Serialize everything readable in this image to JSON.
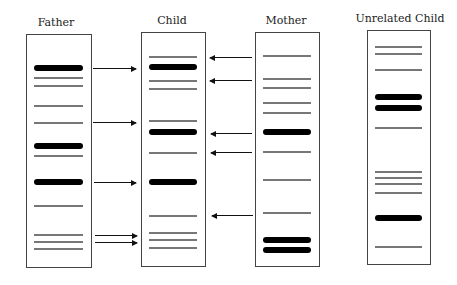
{
  "colors": {
    "thin_band": "#777777",
    "thick_band": "#000000",
    "border": "#444444",
    "arrow": "#111111"
  },
  "lanes": [
    {
      "label": "Father",
      "box": {
        "x": 26,
        "y": 34,
        "w": 66,
        "h": 234
      },
      "label_x": 56,
      "label_y": 16,
      "bands": [
        {
          "y": 68,
          "type": "thick"
        },
        {
          "y": 78,
          "type": "thin"
        },
        {
          "y": 86,
          "type": "thin"
        },
        {
          "y": 106,
          "type": "thin"
        },
        {
          "y": 123,
          "type": "thin"
        },
        {
          "y": 146,
          "type": "thick"
        },
        {
          "y": 156,
          "type": "thin"
        },
        {
          "y": 182,
          "type": "thick"
        },
        {
          "y": 206,
          "type": "thin"
        },
        {
          "y": 235,
          "type": "thin"
        },
        {
          "y": 242,
          "type": "thin"
        },
        {
          "y": 249,
          "type": "thin"
        }
      ]
    },
    {
      "label": "Child",
      "box": {
        "x": 141,
        "y": 32,
        "w": 65,
        "h": 235
      },
      "label_x": 172,
      "label_y": 14,
      "bands": [
        {
          "y": 57,
          "type": "thin"
        },
        {
          "y": 67,
          "type": "thick"
        },
        {
          "y": 81,
          "type": "thin"
        },
        {
          "y": 89,
          "type": "thin"
        },
        {
          "y": 121,
          "type": "thin"
        },
        {
          "y": 132,
          "type": "thick"
        },
        {
          "y": 153,
          "type": "thin"
        },
        {
          "y": 182,
          "type": "thick"
        },
        {
          "y": 216,
          "type": "thin"
        },
        {
          "y": 233,
          "type": "thin"
        },
        {
          "y": 240,
          "type": "thin"
        },
        {
          "y": 248,
          "type": "thin"
        }
      ]
    },
    {
      "label": "Mother",
      "box": {
        "x": 255,
        "y": 32,
        "w": 65,
        "h": 235
      },
      "label_x": 286,
      "label_y": 14,
      "bands": [
        {
          "y": 56,
          "type": "thin"
        },
        {
          "y": 79,
          "type": "thin"
        },
        {
          "y": 88,
          "type": "thin"
        },
        {
          "y": 103,
          "type": "thin"
        },
        {
          "y": 113,
          "type": "thin"
        },
        {
          "y": 132,
          "type": "thick"
        },
        {
          "y": 152,
          "type": "thin"
        },
        {
          "y": 180,
          "type": "thin"
        },
        {
          "y": 213,
          "type": "thin"
        },
        {
          "y": 240,
          "type": "thick"
        },
        {
          "y": 250,
          "type": "thick"
        }
      ]
    },
    {
      "label": "Unrelated Child",
      "box": {
        "x": 367,
        "y": 30,
        "w": 64,
        "h": 235
      },
      "label_x": 400,
      "label_y": 12,
      "bands": [
        {
          "y": 47,
          "type": "thin"
        },
        {
          "y": 54,
          "type": "thin"
        },
        {
          "y": 70,
          "type": "thin"
        },
        {
          "y": 97,
          "type": "thick"
        },
        {
          "y": 108,
          "type": "thick"
        },
        {
          "y": 128,
          "type": "thin"
        },
        {
          "y": 172,
          "type": "thin"
        },
        {
          "y": 178,
          "type": "thin"
        },
        {
          "y": 184,
          "type": "thin"
        },
        {
          "y": 193,
          "type": "thin"
        },
        {
          "y": 218,
          "type": "thick"
        },
        {
          "y": 247,
          "type": "thin"
        }
      ]
    }
  ],
  "arrows": [
    {
      "from": "Father",
      "to": "Child",
      "dir": "right",
      "x1": 93,
      "x2": 136,
      "y": 68
    },
    {
      "from": "Father",
      "to": "Child",
      "dir": "right",
      "x1": 93,
      "x2": 136,
      "y": 122
    },
    {
      "from": "Father",
      "to": "Child",
      "dir": "right",
      "x1": 94,
      "x2": 136,
      "y": 182
    },
    {
      "from": "Father",
      "to": "Child",
      "dir": "right",
      "x1": 95,
      "x2": 137,
      "y": 235
    },
    {
      "from": "Father",
      "to": "Child",
      "dir": "right",
      "x1": 95,
      "x2": 137,
      "y": 242
    },
    {
      "from": "Mother",
      "to": "Child",
      "dir": "left",
      "x1": 210,
      "x2": 252,
      "y": 57
    },
    {
      "from": "Mother",
      "to": "Child",
      "dir": "left",
      "x1": 210,
      "x2": 252,
      "y": 80
    },
    {
      "from": "Mother",
      "to": "Child",
      "dir": "left",
      "x1": 211,
      "x2": 252,
      "y": 133
    },
    {
      "from": "Mother",
      "to": "Child",
      "dir": "left",
      "x1": 211,
      "x2": 252,
      "y": 152
    },
    {
      "from": "Mother",
      "to": "Child",
      "dir": "left",
      "x1": 212,
      "x2": 253,
      "y": 215
    }
  ]
}
